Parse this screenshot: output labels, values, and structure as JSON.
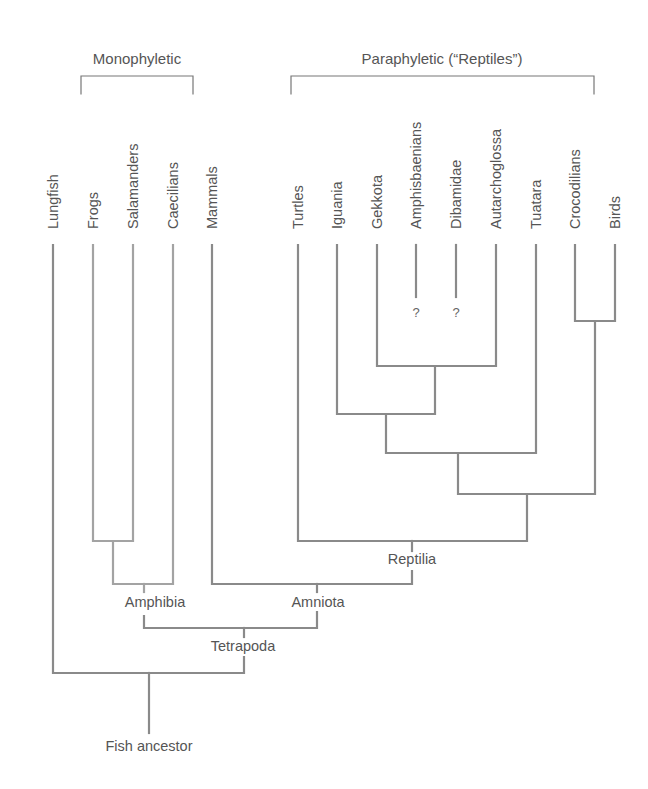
{
  "groups": {
    "monophyletic": "Monophyletic",
    "paraphyletic": "Paraphyletic (“Reptiles”)"
  },
  "taxa": [
    {
      "name": "Lungfish",
      "x": 53
    },
    {
      "name": "Frogs",
      "x": 93
    },
    {
      "name": "Salamanders",
      "x": 133
    },
    {
      "name": "Caecilians",
      "x": 173
    },
    {
      "name": "Mammals",
      "x": 212
    },
    {
      "name": "Turtles",
      "x": 298
    },
    {
      "name": "Iguania",
      "x": 337
    },
    {
      "name": "Gekkota",
      "x": 377
    },
    {
      "name": "Amphisbaenians",
      "x": 416
    },
    {
      "name": "Dibamidae",
      "x": 456
    },
    {
      "name": "Autarchoglossa",
      "x": 496
    },
    {
      "name": "Tuatara",
      "x": 536
    },
    {
      "name": "Crocodilians",
      "x": 575
    },
    {
      "name": "Birds",
      "x": 615
    }
  ],
  "uncertain_marker": "?",
  "nodes": {
    "amphibia": "Amphibia",
    "amniota": "Amniota",
    "reptilia": "Reptilia",
    "tetrapoda": "Tetrapoda",
    "root": "Fish ancestor"
  },
  "colors": {
    "line": "#8a8a8a",
    "amphibian_line": "#a3a3a3",
    "text": "#555555"
  }
}
